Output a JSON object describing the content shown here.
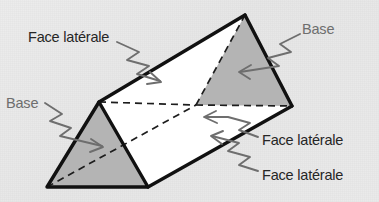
{
  "figure": {
    "shape_name": "triangular-prism",
    "colors": {
      "background": "#e9e9e9",
      "base_face_fill": "#b4b4b4",
      "lateral_face_fill": "#ffffff",
      "outline": "#111111",
      "hidden_edge": "#1a1a1a",
      "leader_line": "#6e6e6e",
      "label_dark": "#262626",
      "label_gray": "#6e6e6e"
    }
  },
  "labels": [
    {
      "id": "face-laterale-top-left",
      "text": "Face latérale",
      "tone": "dark",
      "x": 28,
      "y": 30,
      "target": "top-white-lateral-face"
    },
    {
      "id": "base-top-right",
      "text": "Base",
      "tone": "gray",
      "x": 302,
      "y": 22,
      "target": "back-triangular-base"
    },
    {
      "id": "base-left",
      "text": "Base",
      "tone": "gray",
      "x": 6,
      "y": 96,
      "target": "front-triangular-base"
    },
    {
      "id": "face-laterale-right-middle",
      "text": "Face latérale",
      "tone": "dark",
      "x": 262,
      "y": 133,
      "target": "front-white-lateral-face"
    },
    {
      "id": "face-laterale-right-bottom",
      "text": "Face latérale",
      "tone": "dark",
      "x": 262,
      "y": 168,
      "target": "bottom-hidden-lateral-face"
    }
  ],
  "geometry": {
    "vertices": {
      "front_apex": [
        99,
        102
      ],
      "front_bottom_left": [
        47,
        187
      ],
      "front_bottom_right": [
        148,
        187
      ],
      "back_apex": [
        245,
        15
      ],
      "back_bottom_left": [
        196,
        105
      ],
      "back_bottom_right": [
        292,
        106
      ]
    },
    "faces": [
      {
        "name": "front-triangular-base",
        "kind": "base",
        "fill": "#b4b4b4"
      },
      {
        "name": "back-triangular-base",
        "kind": "base",
        "fill": "#b4b4b4"
      },
      {
        "name": "top-white-lateral-face",
        "kind": "lateral",
        "fill": "#ffffff"
      },
      {
        "name": "front-white-lateral-face",
        "kind": "lateral",
        "fill": "#ffffff"
      },
      {
        "name": "bottom-hidden-lateral-face",
        "kind": "lateral",
        "fill": "#ffffff"
      }
    ],
    "hidden_edges": [
      "front_bottom_left -> back_bottom_left",
      "front_apex -> back_bottom_left",
      "back_bottom_left -> back_apex",
      "back_bottom_left -> back_bottom_right"
    ]
  }
}
